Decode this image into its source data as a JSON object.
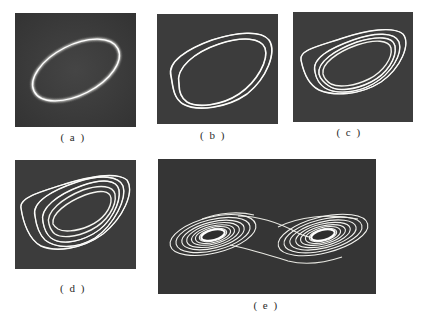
{
  "figure": {
    "panels": [
      {
        "id": "a",
        "label": "( a )",
        "content": "single-loop limit cycle"
      },
      {
        "id": "b",
        "label": "( b )",
        "content": "period-2 limit cycle"
      },
      {
        "id": "c",
        "label": "( c )",
        "content": "period-4 limit cycle"
      },
      {
        "id": "d",
        "label": "( d )",
        "content": "single-scroll chaotic attractor"
      },
      {
        "id": "e",
        "label": "( e )",
        "content": "double-scroll chaotic attractor"
      }
    ],
    "colors": {
      "screen_background": "#3b3b3b",
      "trace": "#f2f2ee",
      "page_background": "#ffffff"
    }
  }
}
